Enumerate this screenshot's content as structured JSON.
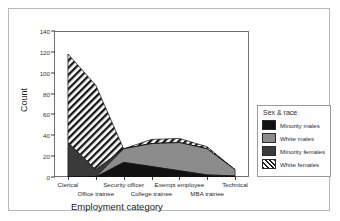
{
  "chart_data": {
    "type": "area",
    "stacked": true,
    "title": "",
    "xlabel": "Employment category",
    "ylabel": "Count",
    "ylim": [
      0,
      140
    ],
    "yticks": [
      0,
      20,
      40,
      60,
      80,
      100,
      120,
      140
    ],
    "grid": false,
    "legend_position": "right",
    "legend_title": "Sex & race",
    "categories": [
      "Clerical",
      "Office trainee",
      "Security officer",
      "College trainee",
      "Exempt employee",
      "MBA trainee",
      "Technical"
    ],
    "series": [
      {
        "name": "Minority males",
        "color": "#111111",
        "pattern": "solid",
        "values": [
          0,
          0,
          14,
          10,
          6,
          2,
          1
        ]
      },
      {
        "name": "White males",
        "color": "#8c8c8c",
        "pattern": "solid",
        "values": [
          0,
          0,
          13,
          22,
          27,
          25,
          6
        ]
      },
      {
        "name": "Minority females",
        "color": "#3a3a3a",
        "pattern": "solid",
        "values": [
          33,
          7,
          0,
          0,
          0,
          0,
          0
        ]
      },
      {
        "name": "White females",
        "color": "#1c1c1c",
        "pattern": "hatch",
        "values": [
          85,
          81,
          0,
          4,
          4,
          2,
          0
        ]
      }
    ],
    "totals": [
      118,
      88,
      27,
      36,
      37,
      29,
      7
    ]
  },
  "legend": {
    "title": "Sex & race",
    "entries": [
      {
        "label": "Minority males"
      },
      {
        "label": "White males"
      },
      {
        "label": "Minority females"
      },
      {
        "label": "White females"
      }
    ]
  },
  "axes": {
    "y_title": "Count",
    "x_title": "Employment category",
    "y_ticks": [
      "0",
      "20",
      "40",
      "60",
      "80",
      "100",
      "120",
      "140"
    ],
    "x_ticks": [
      "Clerical",
      "Office trainee",
      "Security officer",
      "College trainee",
      "Exempt employee",
      "MBA trainee",
      "Technical"
    ]
  }
}
